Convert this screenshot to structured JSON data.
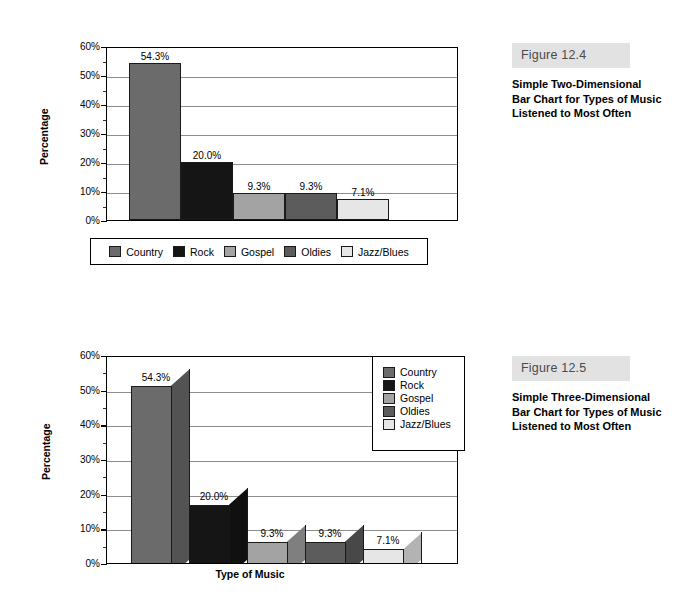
{
  "page": {
    "background": "#ffffff"
  },
  "figures": [
    {
      "id": "figure-12-4",
      "banner": "Figure 12.4",
      "caption": "Simple Two-Dimensional Bar Chart for Types of Music Listened to Most Often",
      "chart_data": {
        "type": "bar",
        "title": "",
        "subtitle": "",
        "xlabel": "",
        "ylabel": "Percentage",
        "categories": [
          "Country",
          "Rock",
          "Gospel",
          "Oldies",
          "Jazz/Blues"
        ],
        "values": [
          54.3,
          20.0,
          9.3,
          9.3,
          7.1
        ],
        "data_labels": [
          "54.3%",
          "20.0%",
          "9.3%",
          "9.3%",
          "7.1%"
        ],
        "ylim": [
          0,
          60
        ],
        "ytick_labels": [
          "0%",
          "10%",
          "20%",
          "30%",
          "40%",
          "50%",
          "60%"
        ],
        "ytick_values": [
          0,
          10,
          20,
          30,
          40,
          50,
          60
        ],
        "yminor_values": [
          5,
          15,
          25,
          35,
          45,
          55
        ],
        "grid": true,
        "legend_position": "bottom",
        "colors": [
          "#6b6b6b",
          "#151515",
          "#a3a3a3",
          "#5c5c5c",
          "#e6e6e6"
        ],
        "three_d": false
      }
    },
    {
      "id": "figure-12-5",
      "banner": "Figure 12.5",
      "caption": "Simple Three-Dimensional Bar Chart for Types of Music Listened to Most Often",
      "chart_data": {
        "type": "bar",
        "title": "",
        "subtitle": "",
        "xlabel": "Type of Music",
        "ylabel": "Percentage",
        "categories": [
          "Country",
          "Rock",
          "Gospel",
          "Oldies",
          "Jazz/Blues"
        ],
        "values": [
          54.3,
          20.0,
          9.3,
          9.3,
          7.1
        ],
        "data_labels": [
          "54.3%",
          "20.0%",
          "9.3%",
          "9.3%",
          "7.1%"
        ],
        "ylim": [
          0,
          60
        ],
        "ytick_labels": [
          "0%",
          "10%",
          "20%",
          "30%",
          "40%",
          "50%",
          "60%"
        ],
        "ytick_values": [
          0,
          10,
          20,
          30,
          40,
          50,
          60
        ],
        "yminor_values": [
          5,
          15,
          25,
          35,
          45,
          55
        ],
        "grid": true,
        "legend_position": "right",
        "colors": [
          "#6b6b6b",
          "#151515",
          "#a3a3a3",
          "#5c5c5c",
          "#e6e6e6"
        ],
        "three_d": true
      }
    }
  ]
}
